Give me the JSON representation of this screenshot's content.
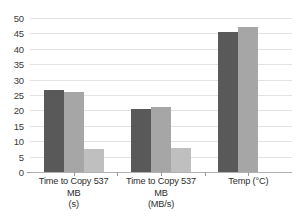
{
  "chart_data": {
    "type": "bar",
    "title": "",
    "subtitle": "",
    "xlabel": "",
    "ylabel": "",
    "ylim": [
      0,
      50
    ],
    "ytick_step": 5,
    "yticks": [
      50,
      45,
      40,
      35,
      30,
      25,
      20,
      15,
      10,
      5,
      0
    ],
    "grid": true,
    "legend": false,
    "legend_position": "none",
    "categories": [
      "Time to Copy 537 MB (s)",
      "Time to Copy 537 MB (MB/s)",
      "Temp (°C)"
    ],
    "category_lines": [
      {
        "main": "Time to Copy 537 MB",
        "unit": "(s)"
      },
      {
        "main": "Time to Copy 537 MB",
        "unit": "(MB/s)"
      },
      {
        "main": "Temp (°C)",
        "unit": ""
      }
    ],
    "series": [
      {
        "name": "series-1",
        "color": "#595959",
        "values": [
          26.5,
          20.5,
          45.5
        ]
      },
      {
        "name": "series-2",
        "color": "#a6a6a6",
        "values": [
          26.0,
          21.0,
          47.0
        ]
      },
      {
        "name": "series-3",
        "color": "#bfbfbf",
        "values": [
          7.5,
          7.8,
          null
        ]
      }
    ],
    "colors": {
      "series_1": "#595959",
      "series_2": "#a6a6a6",
      "series_3": "#bfbfbf",
      "gridline": "#e2e2e2",
      "axis": "#b0b0b0",
      "text": "#2d2d2d",
      "background": "#ffffff"
    }
  }
}
